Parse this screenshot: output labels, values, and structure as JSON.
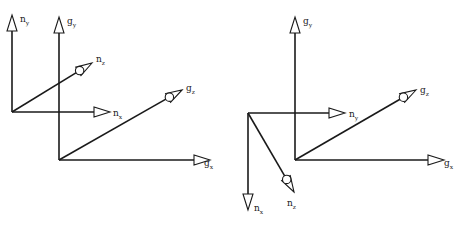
{
  "figures": [
    {
      "id": "left",
      "frames": {
        "n": {
          "origin": [
            12,
            112
          ],
          "axes": [
            {
              "name": "n_y",
              "base": "n",
              "sub": "y",
              "dir": "up",
              "end": [
                12,
                15
              ],
              "label_pos": [
                20,
                22
              ]
            },
            {
              "name": "n_x",
              "base": "n",
              "sub": "x",
              "dir": "right",
              "end": [
                110,
                112
              ],
              "label_pos": [
                113,
                116
              ]
            },
            {
              "name": "n_z",
              "base": "n",
              "sub": "z",
              "dir": "oblique-out",
              "end": [
                92,
                63
              ],
              "label_pos": [
                96,
                62
              ]
            }
          ]
        },
        "g": {
          "origin": [
            59,
            160
          ],
          "axes": [
            {
              "name": "g_y",
              "base": "g",
              "sub": "y",
              "dir": "up",
              "end": [
                59,
                17
              ],
              "label_pos": [
                67,
                24
              ]
            },
            {
              "name": "g_x",
              "base": "g",
              "sub": "x",
              "dir": "right",
              "end": [
                210,
                160
              ],
              "label_pos": [
                204,
                166
              ]
            },
            {
              "name": "g_z",
              "base": "g",
              "sub": "z",
              "dir": "oblique-out",
              "end": [
                182,
                90
              ],
              "label_pos": [
                186,
                91
              ]
            }
          ]
        }
      }
    },
    {
      "id": "right",
      "frames": {
        "n": {
          "origin": [
            248,
            113
          ],
          "axes": [
            {
              "name": "n_x",
              "base": "n",
              "sub": "x",
              "dir": "down",
              "end": [
                248,
                210
              ],
              "label_pos": [
                254,
                211
              ]
            },
            {
              "name": "n_y",
              "base": "n",
              "sub": "y",
              "dir": "right",
              "end": [
                345,
                113
              ],
              "label_pos": [
                349,
                117
              ]
            },
            {
              "name": "n_z",
              "base": "n",
              "sub": "z",
              "dir": "oblique-out",
              "end": [
                294,
                192
              ],
              "label_pos": [
                287,
                206
              ]
            }
          ]
        },
        "g": {
          "origin": [
            295,
            160
          ],
          "axes": [
            {
              "name": "g_y",
              "base": "g",
              "sub": "y",
              "dir": "up",
              "end": [
                295,
                17
              ],
              "label_pos": [
                303,
                24
              ]
            },
            {
              "name": "g_x",
              "base": "g",
              "sub": "x",
              "dir": "right",
              "end": [
                444,
                160
              ],
              "label_pos": [
                444,
                166
              ]
            },
            {
              "name": "g_z",
              "base": "g",
              "sub": "z",
              "dir": "oblique-out",
              "end": [
                416,
                90
              ],
              "label_pos": [
                420,
                93
              ]
            }
          ]
        }
      }
    }
  ],
  "style": {
    "line_color": "#1a1a1a",
    "background": "#ffffff"
  }
}
